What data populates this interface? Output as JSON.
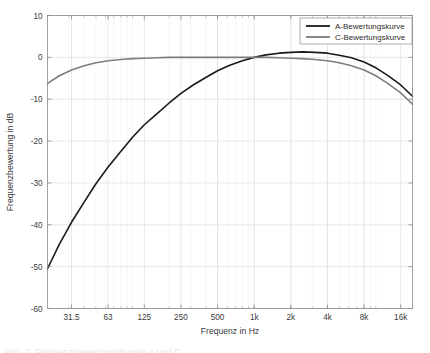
{
  "figure": {
    "background_color": "#ffffff",
    "axes_color": "#8c8c8c",
    "grid_color": "#dcdcdc",
    "minor_grid_color": "#ececec",
    "text_color": "#3a3a3a"
  },
  "caption": {
    "text": "Abb. 2: Frequenzbewertungskurven A und C"
  },
  "chart_data": {
    "type": "line",
    "title": "",
    "subtitle": "",
    "xlabel": "Frequenz in Hz",
    "ylabel": "Frequenzbewertung in dB",
    "xscale": "log",
    "xlim": [
      20,
      20000
    ],
    "ylim": [
      -60,
      10
    ],
    "yticks": [
      10,
      0,
      -10,
      -20,
      -30,
      -40,
      -50,
      -60
    ],
    "ytick_labels": [
      "10",
      "0",
      "-10",
      "-20",
      "-30",
      "-40",
      "-50",
      "-60"
    ],
    "xticks": [
      31.5,
      63,
      125,
      250,
      500,
      1000,
      2000,
      4000,
      8000,
      16000
    ],
    "xtick_labels": [
      "31.5",
      "63",
      "125",
      "250",
      "500",
      "1k",
      "2k",
      "4k",
      "8k",
      "16k"
    ],
    "grid": true,
    "minor_grid": true,
    "legend_position": "upper right",
    "series": [
      {
        "name": "A-Bewertungskurve",
        "color": "#1a1a1a",
        "line_width": 1.6,
        "x": [
          20,
          25,
          31.5,
          40,
          50,
          63,
          80,
          100,
          125,
          160,
          200,
          250,
          315,
          400,
          500,
          630,
          800,
          1000,
          1250,
          1600,
          2000,
          2500,
          3150,
          4000,
          5000,
          6300,
          8000,
          10000,
          12500,
          16000,
          20000
        ],
        "y": [
          -50.5,
          -44.7,
          -39.4,
          -34.6,
          -30.2,
          -26.2,
          -22.5,
          -19.1,
          -16.1,
          -13.4,
          -10.9,
          -8.6,
          -6.6,
          -4.8,
          -3.2,
          -1.9,
          -0.8,
          0.0,
          0.6,
          1.0,
          1.2,
          1.3,
          1.2,
          1.0,
          0.5,
          -0.1,
          -1.1,
          -2.5,
          -4.3,
          -6.6,
          -9.3
        ]
      },
      {
        "name": "C-Bewertungskurve",
        "color": "#7d7d7d",
        "line_width": 1.6,
        "x": [
          20,
          25,
          31.5,
          40,
          50,
          63,
          80,
          100,
          125,
          160,
          200,
          250,
          315,
          400,
          500,
          630,
          800,
          1000,
          1250,
          1600,
          2000,
          2500,
          3150,
          4000,
          5000,
          6300,
          8000,
          10000,
          12500,
          16000,
          20000
        ],
        "y": [
          -6.2,
          -4.4,
          -3.0,
          -2.0,
          -1.3,
          -0.8,
          -0.5,
          -0.3,
          -0.2,
          -0.1,
          0.0,
          0.0,
          0.0,
          0.0,
          0.0,
          0.0,
          0.0,
          0.0,
          0.0,
          -0.1,
          -0.2,
          -0.3,
          -0.5,
          -0.8,
          -1.3,
          -2.0,
          -3.0,
          -4.4,
          -6.2,
          -8.5,
          -11.2
        ]
      }
    ]
  },
  "legend": {
    "entries": [
      {
        "label": "A-Bewertungskurve",
        "color": "#1a1a1a"
      },
      {
        "label": "C-Bewertungskurve",
        "color": "#7d7d7d"
      }
    ]
  }
}
